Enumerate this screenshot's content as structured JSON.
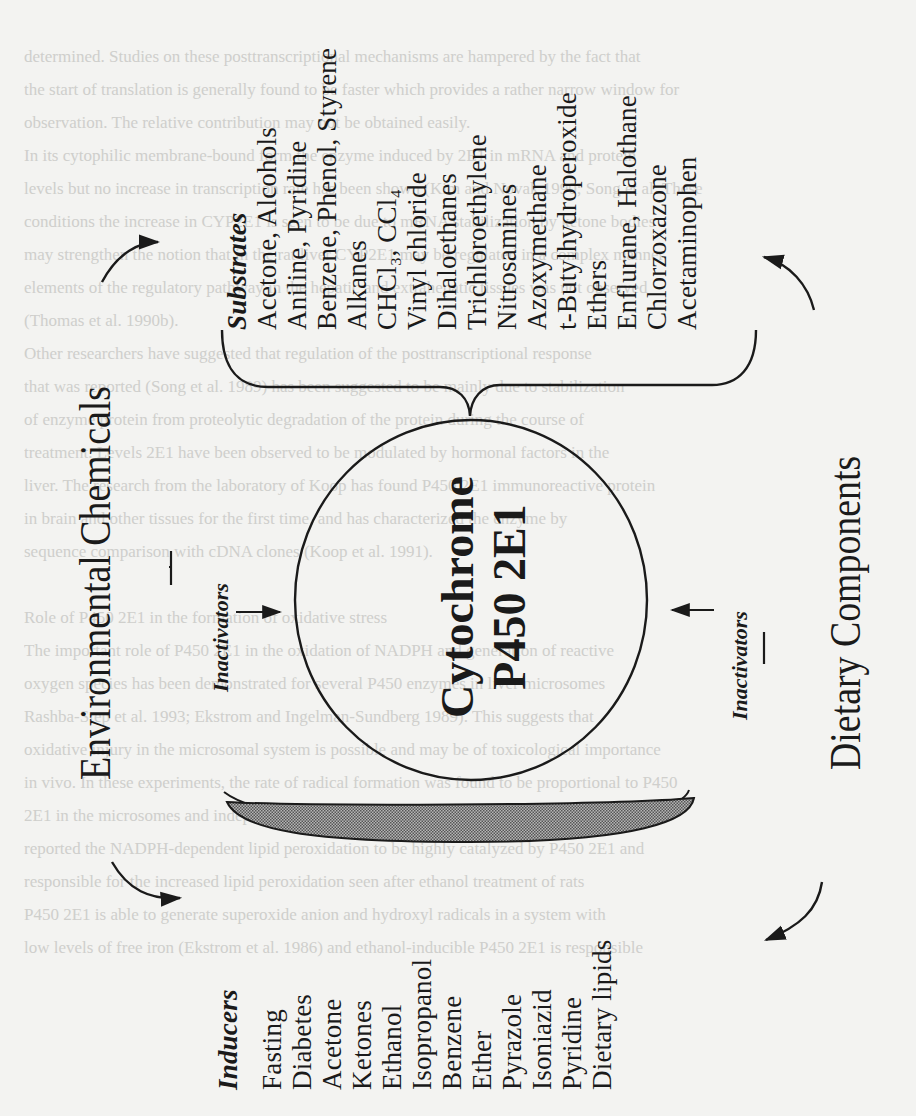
{
  "figure": {
    "center_label": {
      "line1": "Cytochrome",
      "line2": "P450 2E1"
    },
    "left_source": "Environmental Chemicals",
    "right_source": "Dietary Components",
    "inactivators_left": "Inactivators",
    "inactivators_right": "Inactivators",
    "substrates": {
      "heading": "Substrates",
      "items": [
        "Acetone, Alcohols",
        "Aniline, Pyridine",
        "Benzene, Phenol, Styrene",
        "Alkanes",
        "CHCl₃, CCl₄",
        "Vinyl chloride",
        "Dihaloethanes",
        "Trichloroethylene",
        "Nitrosamines",
        "Azoxymethane",
        "t-Butylhydroperoxide",
        "Ethers",
        "Enflurane, Halothane",
        "Chlorzoxazone",
        "Acetaminophen"
      ]
    },
    "inducers": {
      "heading": "Inducers",
      "items": [
        "Fasting",
        "Diabetes",
        "Acetone",
        "Ketones",
        "Ethanol",
        "Isopropanol",
        "Benzene",
        "Ether",
        "Pyrazole",
        "Isoniazid",
        "Pyridine",
        "Dietary lipids"
      ]
    },
    "colors": {
      "ink": "#1a1a1a",
      "paper": "#f3f3f1",
      "membrane_fill": "#8a8a8a",
      "bleed_text": "#c9c9c6"
    }
  },
  "bleed_through_text": [
    "determined. Studies on these posttranscriptional mechanisms are hampered by the fact that",
    "the start of translation is generally found to be faster which provides a rather narrow window for",
    "observation. The relative contribution may not be obtained easily.",
    "In its cytophilic membrane-bound form the enzyme induced by 2E1 in mRNA and protein",
    "levels but no increase in transcription rate has been shown (Kim and Novak 1990; Song et al. These",
    "conditions the increase in CYP2E1 is seen to be due to mRNA stabilization by ketone bodies",
    "may strengthen the notion that in the rat liver CYP2E1 may be regulated in a complex manner",
    "elements of the regulatory pathway in the hepatic and extrahepatic tissues was not observed",
    "(Thomas et al. 1990b).",
    "Other researchers have suggested that regulation of the posttranscriptional response",
    "that was reported (Song et al. 1989) has been suggested to be mainly due to stabilization",
    "of enzyme protein from proteolytic degradation of the protein during the course of",
    "treatment. Levels 2E1 have been observed to be modulated by hormonal factors in the",
    "liver. The research from the laboratory of Koop has found P450 2E1 immunoreactive protein",
    "in brain and other tissues for the first time, and has characterized the enzyme by",
    "sequence comparison with cDNA clones (Koop et al. 1991).",
    "",
    "Role of P450 2E1 in the formation of oxidative stress",
    "The important role of P450 2E1 in the oxidation of NADPH and generation of reactive",
    "oxygen species has been demonstrated for several P450 enzymes in liver microsomes",
    "Rashba-Step et al. 1993; Ekstrom and Ingelman-Sundberg 1989). This suggests that",
    "oxidative injury in the microsomal system is possible and may be of toxicological importance",
    "in vivo. In these experiments, the rate of radical formation was found to be proportional to P450",
    "2E1 in the microsomes and independent of the presence of other P450s, and Koop et al.",
    "reported the NADPH-dependent lipid peroxidation to be highly catalyzed by P450 2E1 and",
    "responsible for the increased lipid peroxidation seen after ethanol treatment of rats",
    "P450 2E1 is able to generate superoxide anion and hydroxyl radicals in a system with",
    "low levels of free iron (Ekstrom et al. 1986) and ethanol-inducible P450 2E1 is responsible"
  ]
}
